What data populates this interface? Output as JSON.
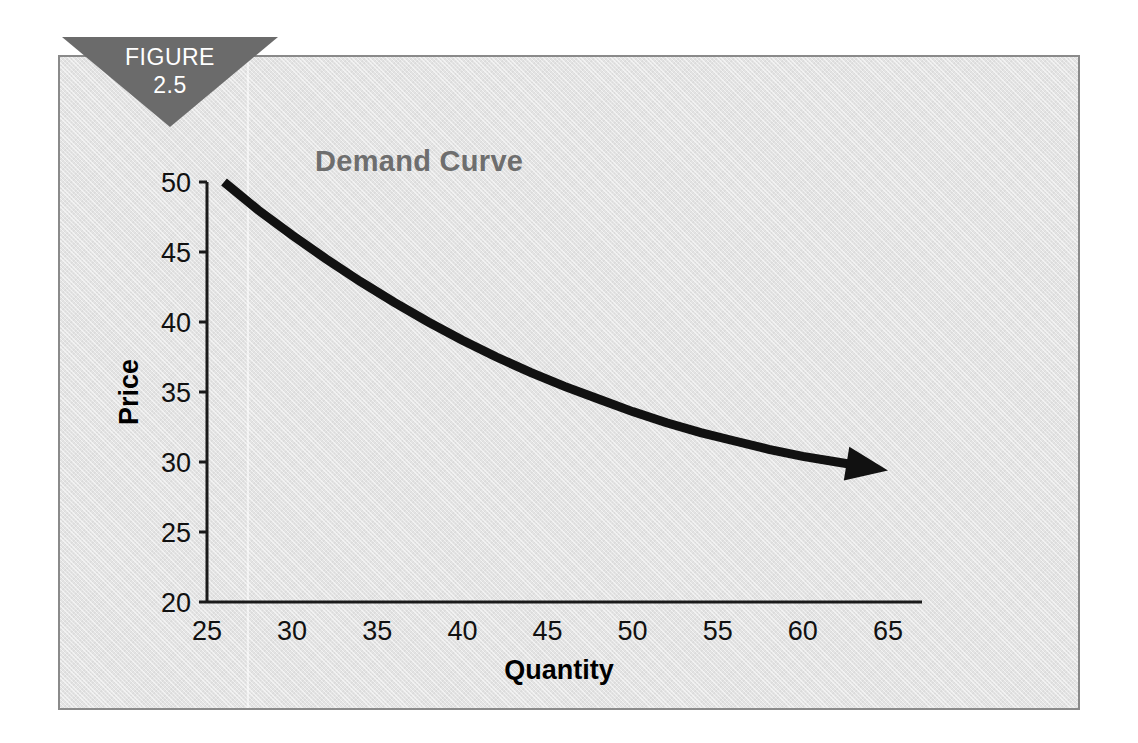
{
  "figure": {
    "badge_kicker": "FIGURE",
    "badge_number": "2.5",
    "badge_color": "#6b6b6b",
    "badge_text_color": "#ffffff",
    "panel_bg": "#e3e3e3",
    "panel_border": "#8a8a8a",
    "page_bg": "#ffffff"
  },
  "chart_data": {
    "type": "line",
    "title": "Demand Curve",
    "title_color": "#6e6e6e",
    "xlabel": "Quantity",
    "ylabel": "Price",
    "xlim": [
      25,
      67
    ],
    "ylim": [
      20,
      50
    ],
    "xticks": [
      25,
      30,
      35,
      40,
      45,
      50,
      55,
      60,
      65
    ],
    "xtick_labels": [
      "25",
      "30",
      "35",
      "40",
      "45",
      "50",
      "55",
      "60",
      "65"
    ],
    "yticks": [
      20,
      25,
      30,
      35,
      40,
      45,
      50
    ],
    "ytick_labels": [
      "20",
      "25",
      "30",
      "35",
      "40",
      "45",
      "50"
    ],
    "grid": false,
    "legend": null,
    "series": [
      {
        "name": "Demand",
        "color": "#111111",
        "line_width": 9,
        "arrow_end": true,
        "x": [
          26.0,
          28.0,
          30.0,
          32.0,
          34.0,
          36.0,
          38.0,
          40.0,
          42.0,
          44.0,
          46.0,
          48.0,
          50.0,
          52.0,
          54.0,
          56.0,
          58.0,
          60.0,
          62.0,
          64.0,
          65.0
        ],
        "y": [
          50.0,
          48.0,
          46.2,
          44.5,
          42.9,
          41.4,
          40.0,
          38.7,
          37.5,
          36.4,
          35.4,
          34.5,
          33.6,
          32.8,
          32.1,
          31.5,
          30.9,
          30.4,
          30.0,
          29.6,
          29.4
        ]
      }
    ],
    "annotations": []
  }
}
